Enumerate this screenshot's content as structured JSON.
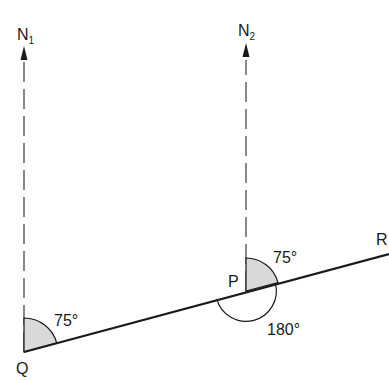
{
  "diagram": {
    "type": "bearing-diagram",
    "points": {
      "Q": {
        "label": "Q"
      },
      "P": {
        "label": "P"
      },
      "R": {
        "label": "R"
      }
    },
    "north_lines": [
      {
        "label_main": "N",
        "label_sub": "1"
      },
      {
        "label_main": "N",
        "label_sub": "2"
      }
    ],
    "angles": {
      "at_Q": "75°",
      "at_P_bearing": "75°",
      "at_P_back": "180°"
    },
    "colors": {
      "line": "#1a1a1a",
      "dash": "#444444",
      "shade": "#d9d9d9"
    }
  }
}
